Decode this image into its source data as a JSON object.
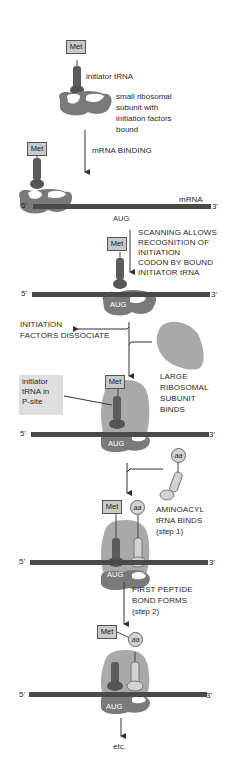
{
  "colors": {
    "mrna": "#4a4a4a",
    "small_subunit": "#7a7a7a",
    "large_subunit": "#a9a9a9",
    "initiator_trna": "#5c5c5c",
    "aminoacyl_trna": "#d2d2d2",
    "label_box": "#c9c9c9",
    "highlight_box": "#dedede"
  },
  "stages": [
    {
      "id": "stage1",
      "met_label": "Met",
      "labels": {
        "initiator_trna": "initiator tRNA",
        "small_subunit": [
          "small ribosomal",
          "subunit with",
          "initiation factors",
          "bound"
        ]
      },
      "icons": [
        "met-box",
        "initiator-trna-icon",
        "small-subunit-icon"
      ]
    },
    {
      "id": "stage2",
      "step_label": "mRNA BINDING",
      "met_label": "Met",
      "mrna_label": "mRNA",
      "five_prime": "5'",
      "three_prime": "3'",
      "codon": "AUG"
    },
    {
      "id": "stage3",
      "step_label": [
        "SCANNING ALLOWS",
        "RECOGNITION OF",
        "INITIATION",
        "CODON BY BOUND",
        "INITIATOR tRNA"
      ],
      "met_label": "Met",
      "five_prime": "5'",
      "three_prime": "3'",
      "codon": "AUG"
    },
    {
      "id": "stage4",
      "side_label_left": [
        "INITIATION",
        "FACTORS DISSOCIATE"
      ],
      "side_label_right": [
        "LARGE",
        "RIBOSOMAL",
        "SUBUNIT",
        "BINDS"
      ],
      "callout": [
        "initiator",
        "tRNA in",
        "P-site"
      ],
      "met_label": "Met",
      "five_prime": "5'",
      "three_prime": "3'",
      "codon": "AUG"
    },
    {
      "id": "stage5",
      "side_label_right": [
        "AMINOACYL",
        "tRNA BINDS",
        "(step 1)"
      ],
      "aa_label": "aa",
      "met_label": "Met",
      "five_prime": "5'",
      "three_prime": "3'",
      "codon": "AUG"
    },
    {
      "id": "stage6",
      "step_label": [
        "FIRST PEPTIDE",
        "BOND FORMS",
        "(step 2)"
      ],
      "met_label": "Met",
      "aa_label": "aa",
      "five_prime": "5'",
      "three_prime": "3'",
      "codon": "AUG",
      "final_label": "etc."
    }
  ]
}
